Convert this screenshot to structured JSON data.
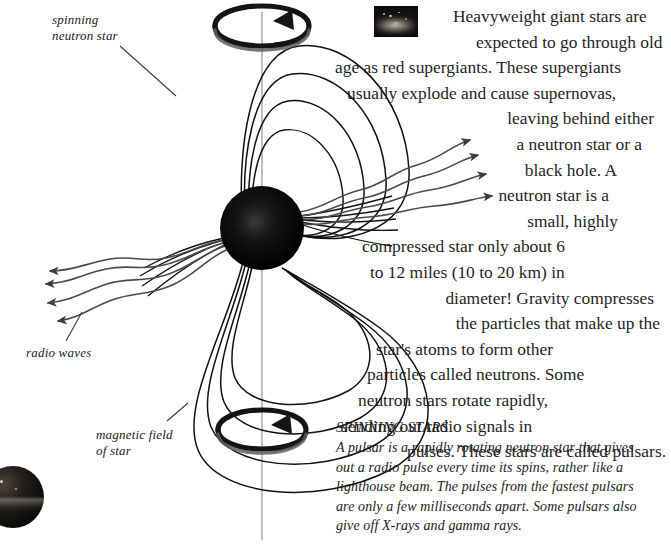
{
  "page": {
    "background": "#ffffff",
    "ink": "#1f1f1f"
  },
  "diagram": {
    "labels": {
      "spinning_neutron_star": "spinning\nneutron star",
      "radio_waves": "radio waves",
      "magnetic_field_of_star": "magnetic field\nof star"
    },
    "icons": {
      "top_rotation_arrow": "rotation-arrow-icon",
      "bottom_rotation_arrow": "rotation-arrow-icon",
      "star_body": "neutron-star-sphere",
      "spin_axis": "spin-axis-line",
      "field_lines": "magnetic-field-lines",
      "radio_beam_left": "radio-wave-arrows-left",
      "radio_beam_right": "radio-wave-arrows-right"
    }
  },
  "photos": {
    "supernova_thumb_alt": "supernova-remnant-photo",
    "planet_thumb_alt": "dark-star-photo"
  },
  "body_copy": {
    "lines": [
      "Heavyweight giant stars are",
      "expected to go through old",
      "age as red supergiants. These supergiants",
      "usually explode and cause supernovas,",
      "leaving behind either",
      "a neutron star or a",
      "black hole. A",
      "neutron star is a",
      "small, highly",
      "compressed star only about 6",
      "to 12 miles (10 to 20 km) in",
      "diameter! Gravity compresses",
      "the particles that make up the",
      "star's atoms to form other",
      "particles called neutrons. Some",
      "neutron stars rotate rapidly,",
      "sending out radio signals in",
      "pulses. These stars are called pulsars."
    ],
    "full_text": "Heavyweight giant stars are expected to go through old age as red supergiants. These supergiants usually explode and cause supernovas, leaving behind either a neutron star or a black hole. A neutron star is a small, highly compressed star only about 6 to 12 miles (10 to 20 km) in diameter! Gravity compresses the particles that make up the star's atoms to form other particles called neutrons. Some neutron stars rotate rapidly, sending out radio signals in pulses. These stars are called pulsars."
  },
  "caption": {
    "title": "SPINNING STARS",
    "lines": [
      "A pulsar is a rapidly rotating neutron star that gives",
      "out a radio pulse every time its spins, rather like a",
      "lighthouse beam. The pulses from the fastest pulsars",
      "are only a few milliseconds apart. Some pulsars also",
      "give off X-rays and gamma rays."
    ],
    "full_text": "A pulsar is a rapidly rotating neutron star that gives out a radio pulse every time its spins, rather like a lighthouse beam. The pulses from the fastest pulsars are only a few milliseconds apart. Some pulsars also give off X-rays and gamma rays."
  }
}
